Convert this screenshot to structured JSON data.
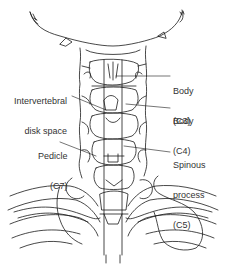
{
  "figure": {
    "labels": [
      {
        "id": "body-c3",
        "lines": [
          "Body",
          "(C3)"
        ],
        "side": "right"
      },
      {
        "id": "intervertebral-disk-space",
        "lines": [
          "Intervertebral",
          "disk space"
        ],
        "side": "left"
      },
      {
        "id": "body-c4",
        "lines": [
          "Body",
          "(C4)"
        ],
        "side": "right"
      },
      {
        "id": "pedicle-c7",
        "lines": [
          "Pedicle",
          "(C7)"
        ],
        "side": "left"
      },
      {
        "id": "spinous-process-c5",
        "lines": [
          "Spinous",
          "process",
          "(C5)"
        ],
        "side": "right"
      }
    ]
  },
  "colors": {
    "line": "#1a1a1a",
    "text": "#333333",
    "background": "#ffffff"
  }
}
